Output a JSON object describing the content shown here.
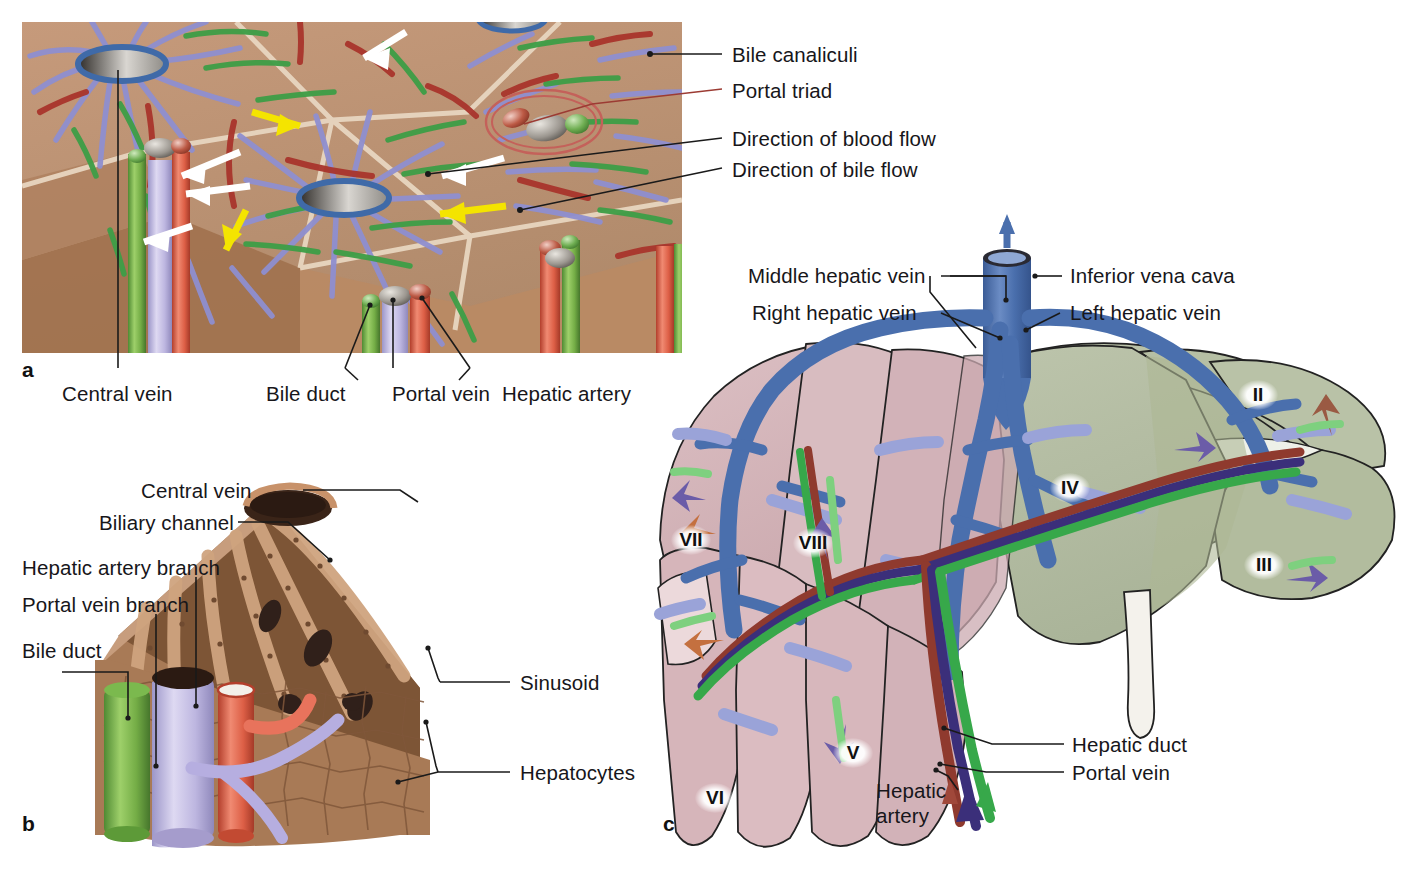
{
  "figure": {
    "panels": [
      {
        "letter": "a",
        "name": "Hepatic lobules, portal triads and flow directions"
      },
      {
        "letter": "b",
        "name": "Cut-away of a single hepatic lobule"
      },
      {
        "letter": "c",
        "name": "Liver segments with hepatic veins and portal structures"
      }
    ]
  },
  "panel_a": {
    "letter": "a",
    "labels_right": [
      {
        "id": "bile-canaliculi",
        "text": "Bile canaliculi"
      },
      {
        "id": "portal-triad",
        "text": "Portal triad"
      },
      {
        "id": "direction-blood-flow",
        "text": "Direction of blood flow"
      },
      {
        "id": "direction-bile-flow",
        "text": "Direction of bile flow"
      }
    ],
    "labels_bottom": [
      {
        "id": "central-vein",
        "text": "Central vein"
      },
      {
        "id": "bile-duct",
        "text": "Bile duct"
      },
      {
        "id": "portal-vein",
        "text": "Portal vein"
      },
      {
        "id": "hepatic-artery",
        "text": "Hepatic artery"
      }
    ],
    "colors": {
      "lobule_surface": "#bd9172",
      "lobule_side": "#a9795a",
      "septum": "#e3cdb5",
      "sinusoid": "#8f8fd0",
      "bile_canaliculus": "#3f9e47",
      "artery": "#a9352c",
      "central_vein_ring": "#3f6aa8",
      "blood_arrow": "#ffffff",
      "bile_arrow": "#f4e400",
      "portal_triad_circle": "#c4615a"
    }
  },
  "panel_b": {
    "letter": "b",
    "labels": [
      {
        "id": "central-vein",
        "text": "Central vein"
      },
      {
        "id": "biliary-channel",
        "text": "Biliary channel"
      },
      {
        "id": "hepatic-artery-branch",
        "text": "Hepatic artery branch"
      },
      {
        "id": "portal-vein-branch",
        "text": "Portal vein branch"
      },
      {
        "id": "bile-duct",
        "text": "Bile duct"
      },
      {
        "id": "sinusoid",
        "text": "Sinusoid"
      },
      {
        "id": "hepatocytes",
        "text": "Hepatocytes"
      }
    ],
    "colors": {
      "tissue_light": "#c8a183",
      "tissue_mid": "#a97a55",
      "tissue_dark": "#6f4a30",
      "bile_duct": "#78b84c",
      "portal_vein": "#c3bee6",
      "hepatic_artery": "#e0604a"
    }
  },
  "panel_c": {
    "letter": "c",
    "labels": [
      {
        "id": "middle-hepatic-vein",
        "text": "Middle hepatic vein"
      },
      {
        "id": "right-hepatic-vein",
        "text": "Right hepatic vein"
      },
      {
        "id": "inferior-vena-cava",
        "text": "Inferior vena cava"
      },
      {
        "id": "left-hepatic-vein",
        "text": "Left hepatic vein"
      },
      {
        "id": "hepatic-duct",
        "text": "Hepatic duct"
      },
      {
        "id": "portal-vein",
        "text": "Portal vein"
      },
      {
        "id": "hepatic-artery",
        "text": "Hepatic artery"
      }
    ],
    "segments": [
      {
        "id": "segment-ii",
        "numeral": "II"
      },
      {
        "id": "segment-iii",
        "numeral": "III"
      },
      {
        "id": "segment-iv",
        "numeral": "IV"
      },
      {
        "id": "segment-v",
        "numeral": "V"
      },
      {
        "id": "segment-vi",
        "numeral": "VI"
      },
      {
        "id": "segment-vii",
        "numeral": "VII"
      },
      {
        "id": "segment-viii",
        "numeral": "VIII"
      }
    ],
    "colors": {
      "right_lobe": "#d6b5ba",
      "left_lobe": "#b6bfa4",
      "caudate": "#e8d6d8",
      "vein_blue": "#4a6fad",
      "portal_branch": "#9aa3d8",
      "hepatic_duct_green": "#37a84a",
      "portal_vein_purple": "#3b2f7a",
      "hepatic_artery_red": "#8f3a2e",
      "gallbladder": "#f2f0ea"
    }
  }
}
